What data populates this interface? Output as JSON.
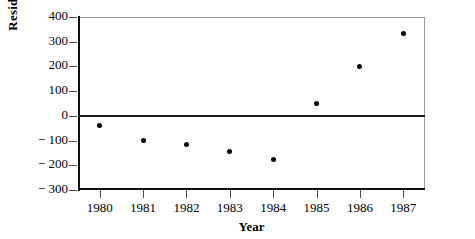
{
  "chart_data": {
    "type": "scatter",
    "title": "",
    "xlabel": "Year",
    "ylabel": "Residuals",
    "categories": [
      "1980",
      "1981",
      "1982",
      "1983",
      "1984",
      "1985",
      "1986",
      "1987"
    ],
    "x": [
      1980,
      1981,
      1982,
      1983,
      1984,
      1985,
      1986,
      1987
    ],
    "values": [
      -40,
      -100,
      -115,
      -145,
      -178,
      50,
      200,
      335
    ],
    "series": [
      {
        "name": "Residuals",
        "values": [
          -40,
          -100,
          -115,
          -145,
          -178,
          50,
          200,
          335
        ]
      }
    ],
    "xlim": [
      1979.5,
      1987.5
    ],
    "ylim": [
      -300,
      400
    ],
    "ytick_labels": [
      "400",
      "300",
      "200",
      "100",
      "0",
      "− 100",
      "− 200",
      "− 300"
    ],
    "ytick_values": [
      400,
      300,
      200,
      100,
      0,
      -100,
      -200,
      -300
    ],
    "xtick_labels": [
      "1980",
      "1981",
      "1982",
      "1983",
      "1984",
      "1985",
      "1986",
      "1987"
    ],
    "grid": false,
    "legend": false,
    "reference_lines": [
      {
        "name": "zero-line",
        "orientation": "horizontal",
        "value": 0,
        "color": "#1a1a1a"
      }
    ],
    "marker": {
      "shape": "circle",
      "color": "#000000",
      "size": 5
    },
    "frame_colors": {
      "axis": "#111111",
      "border": "#9a9a9a",
      "tick": "#4a4a4a"
    }
  }
}
